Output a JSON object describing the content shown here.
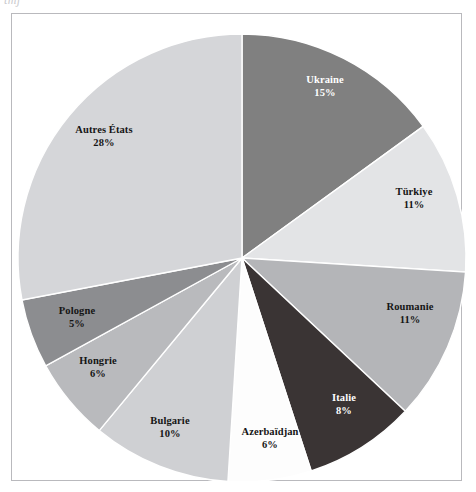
{
  "page": {
    "scan_fragment": "tmj",
    "background_color": "#ffffff",
    "frame_border_color": "#b9b9bd"
  },
  "chart_data": {
    "type": "pie",
    "title": "",
    "subtitle": "",
    "xlabel": "",
    "ylabel": "",
    "legend_position": "none",
    "grid": false,
    "labels_inside": true,
    "start_angle_deg": 0,
    "direction": "clockwise",
    "units": "percent",
    "total": 100,
    "categories": [
      "Ukraine",
      "Türkiye",
      "Roumanie",
      "Italie",
      "Azerbaïdjan",
      "Bulgarie",
      "Hongrie",
      "Pologne",
      "Autres États"
    ],
    "values": [
      15,
      11,
      11,
      8,
      6,
      10,
      6,
      5,
      28
    ],
    "value_labels": [
      "15%",
      "11%",
      "11%",
      "8%",
      "6%",
      "10%",
      "6%",
      "5%",
      "28%"
    ],
    "colors": [
      "#808080",
      "#e3e4e6",
      "#b4b5b8",
      "#3a3434",
      "#fdfdfd",
      "#cfd0d3",
      "#b9babd",
      "#8c8d90",
      "#d5d6d9"
    ],
    "slices": [
      {
        "name": "Ukraine",
        "value": 15,
        "value_label": "15%",
        "color": "#808080",
        "label_color": "#ffffff",
        "label_x": 325,
        "label_y": 86
      },
      {
        "name": "Türkiye",
        "value": 11,
        "value_label": "11%",
        "color": "#e3e4e6",
        "label_color": "#151515",
        "label_x": 414,
        "label_y": 198
      },
      {
        "name": "Roumanie",
        "value": 11,
        "value_label": "11%",
        "color": "#b4b5b8",
        "label_color": "#151515",
        "label_x": 410,
        "label_y": 313
      },
      {
        "name": "Italie",
        "value": 8,
        "value_label": "8%",
        "color": "#3a3434",
        "label_color": "#ffffff",
        "label_x": 344,
        "label_y": 404
      },
      {
        "name": "Azerbaïdjan",
        "value": 6,
        "value_label": "6%",
        "color": "#fdfdfd",
        "label_color": "#151515",
        "label_x": 270,
        "label_y": 438
      },
      {
        "name": "Bulgarie",
        "value": 10,
        "value_label": "10%",
        "color": "#cfd0d3",
        "label_color": "#151515",
        "label_x": 170,
        "label_y": 427
      },
      {
        "name": "Hongrie",
        "value": 6,
        "value_label": "6%",
        "color": "#b9babd",
        "label_color": "#151515",
        "label_x": 98,
        "label_y": 367
      },
      {
        "name": "Pologne",
        "value": 5,
        "value_label": "5%",
        "color": "#8c8d90",
        "label_color": "#151515",
        "label_x": 77,
        "label_y": 317
      },
      {
        "name": "Autres États",
        "value": 28,
        "value_label": "28%",
        "color": "#d5d6d9",
        "label_color": "#151515",
        "label_x": 104,
        "label_y": 136
      }
    ],
    "geometry": {
      "center_x": 242,
      "center_y": 258,
      "radius": 224
    }
  }
}
